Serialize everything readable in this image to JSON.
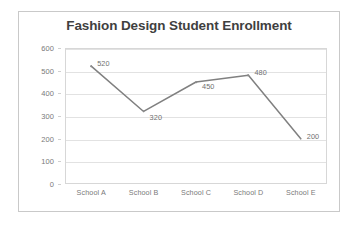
{
  "chart_data": {
    "type": "line",
    "title": "Fashion Design Student Enrollment",
    "xlabel": "",
    "ylabel": "",
    "categories": [
      "School A",
      "School B",
      "School C",
      "School D",
      "School E"
    ],
    "values": [
      520,
      320,
      450,
      480,
      200
    ],
    "data_labels": [
      "520",
      "320",
      "450",
      "480",
      "200"
    ],
    "ylim": [
      0,
      600
    ],
    "y_ticks": [
      "0",
      "100",
      "200",
      "300",
      "400",
      "500",
      "600"
    ],
    "grid": true,
    "legend": false,
    "series_color": "#808080",
    "title_color": "#3f3f3f",
    "gridline_color": "#e2e2e2",
    "axis_text_color": "#7a7a7a"
  }
}
